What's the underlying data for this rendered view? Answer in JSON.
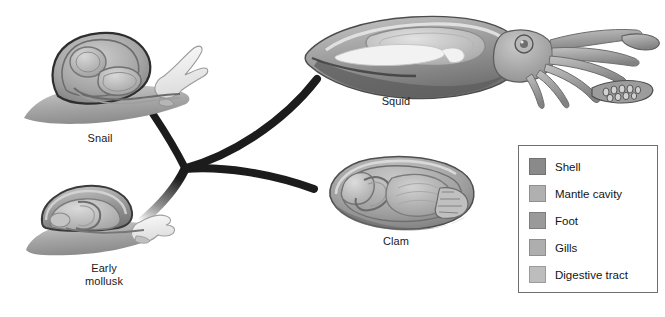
{
  "diagram": {
    "background_color": "#ffffff",
    "branch_color": "#1c1c1c"
  },
  "organisms": [
    {
      "id": "snail",
      "label": "Snail",
      "x": 100,
      "y": 132
    },
    {
      "id": "squid",
      "label": "Squid",
      "x": 396,
      "y": 95
    },
    {
      "id": "clam",
      "label": "Clam",
      "x": 396,
      "y": 235
    },
    {
      "id": "early-mollusk",
      "label": "Early\nmollusk",
      "x": 104,
      "y": 262
    }
  ],
  "legend": {
    "items": [
      {
        "label": "Shell",
        "color": "#8a8a8a"
      },
      {
        "label": "Mantle cavity",
        "color": "#b0b0b0"
      },
      {
        "label": "Foot",
        "color": "#9a9a9a"
      },
      {
        "label": "Gills",
        "color": "#aeaeae"
      },
      {
        "label": "Digestive tract",
        "color": "#bdbdbd"
      }
    ]
  }
}
